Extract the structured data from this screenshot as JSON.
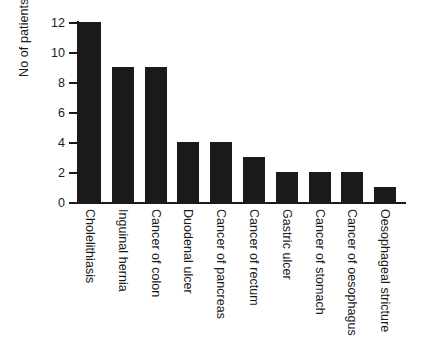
{
  "chart_data": {
    "type": "bar",
    "title": "",
    "xlabel": "",
    "ylabel": "No of patients",
    "ylim": [
      0,
      12
    ],
    "ytick_labels": [
      "0",
      "2",
      "4",
      "6",
      "8",
      "10",
      "12"
    ],
    "ytick_values": [
      0,
      2,
      4,
      6,
      8,
      10,
      12
    ],
    "grid": false,
    "legend": false,
    "bar_color": "#1a1a1a",
    "background_color": "#ffffff",
    "categories": [
      "Cholelithiasis",
      "Inguinal hernia",
      "Cancer of colon",
      "Duodenal ulcer",
      "Cancer of pancreas",
      "Cancer of rectum",
      "Gastric ulcer",
      "Cancer of stomach",
      "Cancer of oesophagus",
      "Oesophageal stricture"
    ],
    "values": [
      12,
      9,
      9,
      4,
      4,
      3,
      2,
      2,
      2,
      1
    ]
  }
}
